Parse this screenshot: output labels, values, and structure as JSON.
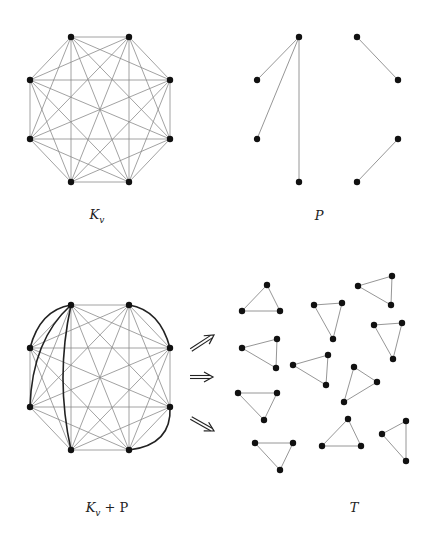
{
  "colors": {
    "edge": "#8a8a8a",
    "bold_edge": "#222222",
    "vertex": "#111111",
    "arrow": "#222222"
  },
  "panels": [
    {
      "id": "kv",
      "label": {
        "main": "K",
        "sub": "v",
        "rest": "",
        "x": 97,
        "y": 207
      },
      "vertices": [
        [
          71,
          37
        ],
        [
          129,
          37
        ],
        [
          170,
          80
        ],
        [
          170,
          139
        ],
        [
          129,
          182
        ],
        [
          71,
          182
        ],
        [
          30,
          139
        ],
        [
          30,
          80
        ]
      ],
      "complete": true,
      "edges": [],
      "bold_curves": []
    },
    {
      "id": "p",
      "label": {
        "main": "P",
        "sub": "",
        "rest": "",
        "x": 319,
        "y": 208
      },
      "vertices": [
        [
          299,
          37
        ],
        [
          357,
          37
        ],
        [
          398,
          80
        ],
        [
          398,
          139
        ],
        [
          357,
          182
        ],
        [
          299,
          182
        ],
        [
          257,
          139
        ],
        [
          257,
          80
        ]
      ],
      "complete": false,
      "edges": [
        [
          0,
          7
        ],
        [
          0,
          6
        ],
        [
          0,
          5
        ],
        [
          1,
          2
        ],
        [
          3,
          4
        ]
      ],
      "bold_curves": []
    },
    {
      "id": "kvp",
      "label": {
        "main": "K",
        "sub": "v",
        "rest": " + P",
        "x": 107,
        "y": 500
      },
      "vertices": [
        [
          71,
          305
        ],
        [
          129,
          305
        ],
        [
          170,
          348
        ],
        [
          170,
          407
        ],
        [
          129,
          450
        ],
        [
          71,
          450
        ],
        [
          30,
          407
        ],
        [
          30,
          348
        ]
      ],
      "complete": true,
      "edges": [],
      "bold_curves": [
        {
          "from": 0,
          "to": 7,
          "c": [
            40,
            310
          ]
        },
        {
          "from": 0,
          "to": 6,
          "c": [
            32,
            340
          ]
        },
        {
          "from": 0,
          "to": 5,
          "c": [
            55,
            378
          ]
        },
        {
          "from": 1,
          "to": 2,
          "c": [
            160,
            310
          ]
        },
        {
          "from": 3,
          "to": 4,
          "c": [
            172,
            445
          ]
        }
      ]
    }
  ],
  "arrows": [
    {
      "x1": 191,
      "y1": 350,
      "x2": 214,
      "y2": 335
    },
    {
      "x1": 190,
      "y1": 377,
      "x2": 213,
      "y2": 377
    },
    {
      "x1": 191,
      "y1": 418,
      "x2": 214,
      "y2": 431
    }
  ],
  "triangles": [
    [
      [
        267,
        285
      ],
      [
        242,
        311
      ],
      [
        280,
        311
      ]
    ],
    [
      [
        314,
        305
      ],
      [
        342,
        303
      ],
      [
        333,
        339
      ]
    ],
    [
      [
        358,
        286
      ],
      [
        392,
        276
      ],
      [
        391,
        305
      ]
    ],
    [
      [
        374,
        325
      ],
      [
        402,
        323
      ],
      [
        393,
        359
      ]
    ],
    [
      [
        242,
        348
      ],
      [
        277,
        339
      ],
      [
        276,
        368
      ]
    ],
    [
      [
        293,
        365
      ],
      [
        328,
        355
      ],
      [
        326,
        385
      ]
    ],
    [
      [
        354,
        367
      ],
      [
        377,
        382
      ],
      [
        344,
        402
      ]
    ],
    [
      [
        238,
        393
      ],
      [
        277,
        393
      ],
      [
        264,
        420
      ]
    ],
    [
      [
        255,
        443
      ],
      [
        293,
        443
      ],
      [
        280,
        470
      ]
    ],
    [
      [
        348,
        419
      ],
      [
        322,
        446
      ],
      [
        361,
        446
      ]
    ],
    [
      [
        382,
        434
      ],
      [
        406,
        421
      ],
      [
        406,
        461
      ]
    ]
  ],
  "t_label": {
    "text": "T",
    "x": 354,
    "y": 500
  }
}
